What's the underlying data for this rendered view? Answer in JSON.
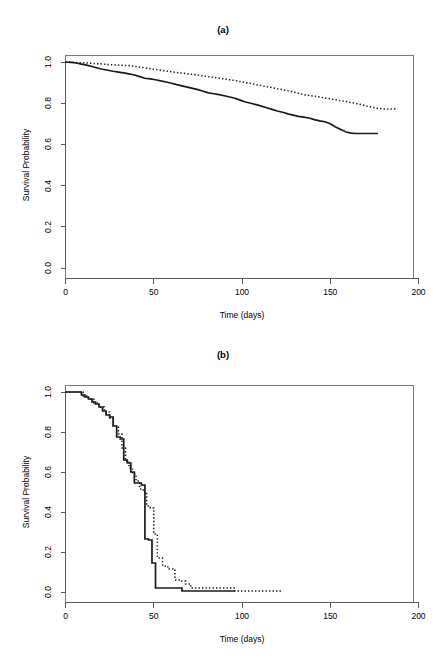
{
  "figure": {
    "background": "#ffffff",
    "width": 446,
    "height": 671
  },
  "panels": [
    {
      "id": "a",
      "title": "(a)",
      "xlabel": "Time (days)",
      "ylabel": "Survival Probability"
    },
    {
      "id": "b",
      "title": "(b)",
      "xlabel": "Time (days)",
      "ylabel": "Survival Probability"
    }
  ],
  "chart_data": [
    {
      "type": "line",
      "panel": "a",
      "title": "(a)",
      "xlabel": "Time (days)",
      "ylabel": "Survival Probability",
      "xlim": [
        0,
        200
      ],
      "ylim": [
        0.0,
        1.0
      ],
      "xticks": [
        0,
        50,
        100,
        150,
        200
      ],
      "yticks": [
        0.0,
        0.2,
        0.4,
        0.6,
        0.8,
        1.0
      ],
      "xtick_labels": [
        "0",
        "50",
        "100",
        "150",
        "200"
      ],
      "ytick_labels": [
        "0.0",
        "0.2",
        "0.4",
        "0.6",
        "0.8",
        "1.0"
      ],
      "grid": false,
      "legend": null,
      "series": [
        {
          "name": "solid-curve",
          "style": "solid",
          "color": "#1a1a1a",
          "x": [
            0,
            3,
            6,
            9,
            12,
            15,
            18,
            21,
            24,
            27,
            30,
            33,
            36,
            39,
            42,
            45,
            48,
            51,
            54,
            57,
            60,
            63,
            66,
            69,
            72,
            75,
            78,
            81,
            84,
            87,
            90,
            93,
            96,
            99,
            102,
            105,
            108,
            111,
            114,
            117,
            120,
            123,
            126,
            129,
            132,
            135,
            138,
            141,
            144,
            147,
            150,
            153,
            156,
            159,
            162,
            165,
            168,
            171,
            174,
            177
          ],
          "y": [
            1.0,
            0.998,
            0.995,
            0.99,
            0.985,
            0.978,
            0.971,
            0.965,
            0.96,
            0.955,
            0.951,
            0.947,
            0.942,
            0.937,
            0.929,
            0.921,
            0.918,
            0.914,
            0.908,
            0.903,
            0.897,
            0.89,
            0.884,
            0.878,
            0.872,
            0.866,
            0.858,
            0.85,
            0.846,
            0.842,
            0.836,
            0.83,
            0.824,
            0.815,
            0.806,
            0.8,
            0.793,
            0.786,
            0.778,
            0.77,
            0.762,
            0.756,
            0.748,
            0.742,
            0.736,
            0.732,
            0.728,
            0.72,
            0.714,
            0.71,
            0.7,
            0.685,
            0.672,
            0.66,
            0.655,
            0.653,
            0.653,
            0.653,
            0.653,
            0.653
          ]
        },
        {
          "name": "dotted-curve",
          "style": "dotted",
          "color": "#1a1a1a",
          "x": [
            0,
            4,
            8,
            12,
            16,
            20,
            24,
            28,
            32,
            36,
            40,
            44,
            48,
            52,
            56,
            60,
            64,
            68,
            72,
            76,
            80,
            84,
            88,
            92,
            96,
            100,
            104,
            108,
            112,
            116,
            120,
            124,
            128,
            132,
            136,
            140,
            144,
            148,
            152,
            156,
            160,
            164,
            168,
            172,
            176,
            180,
            184,
            187
          ],
          "y": [
            1.0,
            0.999,
            0.997,
            0.995,
            0.993,
            0.991,
            0.988,
            0.986,
            0.984,
            0.983,
            0.978,
            0.973,
            0.968,
            0.963,
            0.958,
            0.953,
            0.948,
            0.944,
            0.94,
            0.935,
            0.93,
            0.925,
            0.92,
            0.915,
            0.91,
            0.903,
            0.897,
            0.89,
            0.884,
            0.877,
            0.87,
            0.864,
            0.857,
            0.848,
            0.84,
            0.835,
            0.83,
            0.824,
            0.818,
            0.812,
            0.806,
            0.8,
            0.792,
            0.784,
            0.776,
            0.772,
            0.772,
            0.772
          ]
        }
      ]
    },
    {
      "type": "line",
      "panel": "b",
      "title": "(b)",
      "xlabel": "Time (days)",
      "ylabel": "Survival Probability",
      "xlim": [
        0,
        200
      ],
      "ylim": [
        0.0,
        1.0
      ],
      "xticks": [
        0,
        50,
        100,
        150,
        200
      ],
      "yticks": [
        0.0,
        0.2,
        0.4,
        0.6,
        0.8,
        1.0
      ],
      "xtick_labels": [
        "0",
        "50",
        "100",
        "150",
        "200"
      ],
      "ytick_labels": [
        "0.0",
        "0.2",
        "0.4",
        "0.6",
        "0.8",
        "1.0"
      ],
      "grid": false,
      "legend": null,
      "series": [
        {
          "name": "solid-curve",
          "style": "solid-step",
          "color": "#1a1a1a",
          "x": [
            0,
            6,
            9,
            11,
            13,
            15,
            17,
            19,
            21,
            23,
            25,
            27,
            29,
            31,
            33,
            35,
            37,
            39,
            41,
            43,
            45,
            47,
            49,
            51,
            57,
            63,
            66,
            96
          ],
          "y": [
            1.0,
            1.0,
            0.985,
            0.975,
            0.965,
            0.95,
            0.94,
            0.925,
            0.905,
            0.885,
            0.875,
            0.83,
            0.775,
            0.765,
            0.66,
            0.645,
            0.6,
            0.545,
            0.545,
            0.535,
            0.265,
            0.26,
            0.145,
            0.02,
            0.02,
            0.02,
            0.005,
            0.005
          ]
        },
        {
          "name": "dotted-curve",
          "style": "dotted-step",
          "color": "#1a1a1a",
          "x": [
            0,
            6,
            10,
            13,
            16,
            19,
            22,
            25,
            27,
            30,
            32,
            34,
            36,
            38,
            40,
            42,
            44,
            46,
            48,
            50,
            52,
            55,
            58,
            62,
            65,
            68,
            71,
            96,
            122
          ],
          "y": [
            1.0,
            1.0,
            0.98,
            0.965,
            0.945,
            0.925,
            0.9,
            0.87,
            0.83,
            0.79,
            0.72,
            0.655,
            0.62,
            0.59,
            0.555,
            0.515,
            0.5,
            0.43,
            0.42,
            0.29,
            0.17,
            0.13,
            0.115,
            0.06,
            0.055,
            0.04,
            0.02,
            0.005,
            0.005
          ]
        }
      ]
    }
  ]
}
